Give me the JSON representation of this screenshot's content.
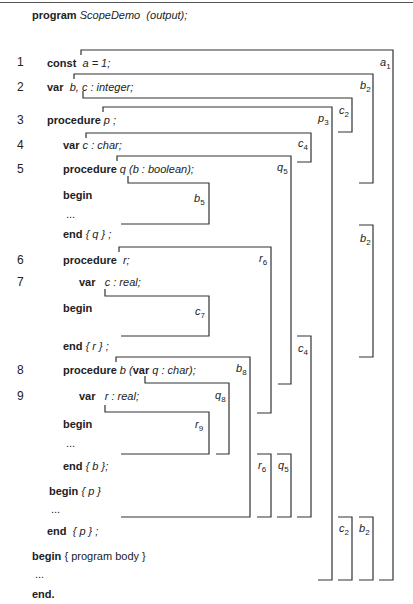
{
  "header": {
    "program_kw": "program",
    "program_name": "ScopeDemo",
    "program_params": "(output);"
  },
  "line_numbers": [
    "1",
    "2",
    "3",
    "4",
    "5",
    "6",
    "7",
    "8",
    "9"
  ],
  "code": {
    "l1_kw": "const",
    "l1_rest": "a = 1;",
    "l2_kw": "var",
    "l2_rest": "b, c :  integer;",
    "l3_kw": "procedure",
    "l3_rest": "p ;",
    "l4_kw": "var",
    "l4_rest": "c :  char;",
    "l5_kw": "procedure",
    "l5_rest": "q (b :  boolean);",
    "q_begin": "begin",
    "q_dots": "...",
    "q_end_kw": "end",
    "q_end_rest": "{ q } ;",
    "l6_kw": "procedure",
    "l6_rest": "r;",
    "l7_kw": "var",
    "l7_rest": "c :  real;",
    "r_begin": "begin",
    "r_end_kw": "end",
    "r_end_rest": "{ r } ;",
    "l8_kw": "procedure",
    "l8_rest1": "b (",
    "l8_var": "var",
    "l8_rest2": "q :  char);",
    "l9_kw": "var",
    "l9_rest": "r :  real;",
    "b_begin": "begin",
    "b_dots": "...",
    "b_end_kw": "end",
    "b_end_rest": "{ b };",
    "p_begin": "begin",
    "p_begin_rest": "{ p }",
    "p_dots": "...",
    "p_end_kw": "end",
    "p_end_rest": "{ p } ;",
    "main_begin": "begin",
    "main_begin_rest": "{ program body }",
    "main_dots": "...",
    "main_end": "end."
  },
  "scope_labels": {
    "a1": {
      "var": "a",
      "sub": "1"
    },
    "b2_top": {
      "var": "b",
      "sub": "2"
    },
    "c2_top": {
      "var": "c",
      "sub": "2"
    },
    "p3": {
      "var": "p",
      "sub": "3"
    },
    "c4_top": {
      "var": "c",
      "sub": "4"
    },
    "q5_top": {
      "var": "q",
      "sub": "5"
    },
    "b5": {
      "var": "b",
      "sub": "5"
    },
    "b2_mid": {
      "var": "b",
      "sub": "2"
    },
    "r6_top": {
      "var": "r",
      "sub": "6"
    },
    "c7": {
      "var": "c",
      "sub": "7"
    },
    "c4_mid": {
      "var": "c",
      "sub": "4"
    },
    "b8": {
      "var": "b",
      "sub": "8"
    },
    "q8": {
      "var": "q",
      "sub": "8"
    },
    "r9": {
      "var": "r",
      "sub": "9"
    },
    "r6_low": {
      "var": "r",
      "sub": "6"
    },
    "q5_low": {
      "var": "q",
      "sub": "5"
    },
    "c2_low": {
      "var": "c",
      "sub": "2"
    },
    "b2_low": {
      "var": "b",
      "sub": "2"
    }
  }
}
